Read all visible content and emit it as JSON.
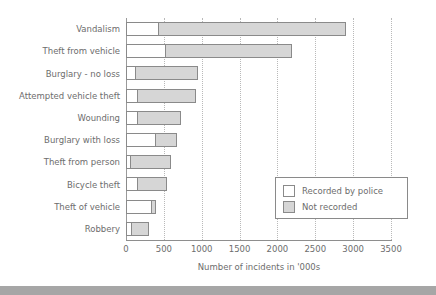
{
  "chart_data": {
    "type": "bar",
    "orientation": "horizontal",
    "stacked": true,
    "title": "",
    "xlabel": "Number of incidents in '000s",
    "ylabel": "",
    "xlim": [
      0,
      3500
    ],
    "xticks": [
      0,
      500,
      1000,
      1500,
      2000,
      2500,
      3000,
      3500
    ],
    "xtick_labels": [
      "0",
      "500",
      "1000",
      "1500",
      "2000",
      "2500",
      "3000",
      "3500"
    ],
    "grid": "vertical-dotted",
    "legend_position": "lower-right",
    "categories": [
      "Vandalism",
      "Theft from vehicle",
      "Burglary - no loss",
      "Attempted vehicle theft",
      "Wounding",
      "Burglary with loss",
      "Theft from person",
      "Bicycle theft",
      "Theft of vehicle",
      "Robbery"
    ],
    "series": [
      {
        "name": "Recorded by police",
        "color": "#ffffff",
        "values": [
          420,
          510,
          120,
          140,
          150,
          380,
          50,
          140,
          330,
          60
        ]
      },
      {
        "name": "Not recorded",
        "color": "#d6d6d6",
        "values": [
          2480,
          1680,
          830,
          790,
          570,
          300,
          550,
          400,
          60,
          250
        ]
      }
    ],
    "totals": [
      2900,
      2190,
      950,
      930,
      720,
      680,
      600,
      540,
      390,
      310
    ]
  },
  "legend": {
    "items": [
      {
        "label": "Recorded by police",
        "swatch": "white-square-icon"
      },
      {
        "label": "Not recorded",
        "swatch": "gray-square-icon"
      }
    ]
  },
  "colors": {
    "recorded": "#ffffff",
    "not_recorded": "#d6d6d6",
    "outline": "#8a8a8a",
    "text": "#6d6d6d",
    "gridline": "#b9b9b9",
    "footer": "#a6a6a6"
  }
}
